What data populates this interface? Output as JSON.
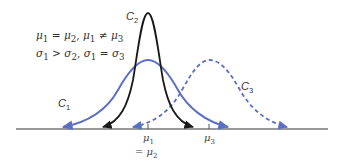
{
  "diagram": {
    "type": "normal-distribution-comparison",
    "conditions": {
      "line1": {
        "lhs": "μ",
        "lhs_sub": "1",
        "rel1": " = ",
        "rhs": "μ",
        "rhs_sub": "2",
        "sep": ", ",
        "lhs2": "μ",
        "lhs2_sub": "1",
        "rel2": " ≠ ",
        "rhs2": "μ",
        "rhs2_sub": "3"
      },
      "line2": {
        "lhs": "σ",
        "lhs_sub": "1",
        "rel1": " > ",
        "rhs": "σ",
        "rhs_sub": "2",
        "sep": ", ",
        "lhs2": "σ",
        "lhs2_sub": "1",
        "rel2": " = ",
        "rhs2": "σ",
        "rhs2_sub": "3"
      }
    },
    "curves": [
      {
        "name": "C",
        "sub": "1",
        "style": "solid",
        "color": "#5b6fc4",
        "mean_label": "μ1",
        "spread": "wide"
      },
      {
        "name": "C",
        "sub": "2",
        "style": "solid",
        "color": "#1a1a1a",
        "mean_label": "μ1 = μ2",
        "spread": "narrow"
      },
      {
        "name": "C",
        "sub": "3",
        "style": "dashed",
        "color": "#5b6fc4",
        "mean_label": "μ3",
        "spread": "wide"
      }
    ],
    "axis": {
      "color": "#777777",
      "ticks": [
        {
          "symbol": "μ",
          "sub": "1",
          "extra_prefix": "= ",
          "extra_symbol": "μ",
          "extra_sub": "2"
        },
        {
          "symbol": "μ",
          "sub": "3"
        }
      ]
    }
  }
}
